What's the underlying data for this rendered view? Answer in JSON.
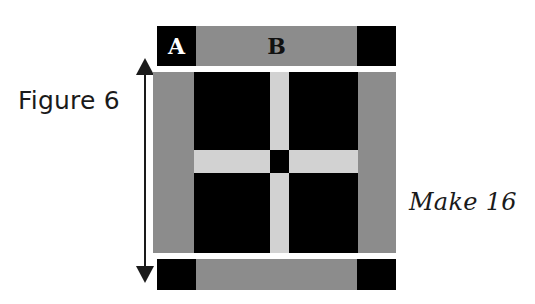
{
  "figure": {
    "caption": "Figure 6",
    "make_label": "Make 16"
  },
  "colors": {
    "fabric_black": "#000000",
    "fabric_medium_gray": "#8c8c8c",
    "fabric_light_gray": "#d2d2d2",
    "background": "#ffffff",
    "ink": "#1a1a1a"
  },
  "dimension_arrow": {
    "name": "height-dimension-arrow",
    "orientation": "vertical",
    "double_headed": true
  },
  "strips": {
    "top": {
      "segments": [
        {
          "label": "A",
          "fabric": "black",
          "text_color": "#ffffff"
        },
        {
          "label": "B",
          "fabric": "medium_gray",
          "text_color": "#111111"
        },
        {
          "label": "",
          "fabric": "black",
          "text_color": "#ffffff"
        }
      ]
    },
    "bottom": {
      "segments": [
        {
          "label": "",
          "fabric": "black"
        },
        {
          "label": "",
          "fabric": "medium_gray"
        },
        {
          "label": "",
          "fabric": "black"
        }
      ]
    }
  },
  "block": {
    "name": "quilt-block",
    "background_fabric": "black",
    "side_borders_fabric": "medium_gray",
    "cross_fabric": "light_gray",
    "center_square_fabric": "black",
    "quadrants": 4
  }
}
